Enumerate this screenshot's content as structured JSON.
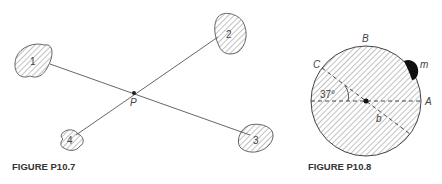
{
  "figures": [
    {
      "caption": "FIGURE P10.7",
      "point_label": "P",
      "bodies": [
        {
          "label": "1"
        },
        {
          "label": "2"
        },
        {
          "label": "3"
        },
        {
          "label": "4"
        }
      ]
    },
    {
      "caption": "FIGURE P10.8",
      "labels": {
        "a": "A",
        "b_top": "B",
        "c": "C",
        "mass": "m",
        "radius": "b",
        "angle": "37°"
      }
    }
  ],
  "colors": {
    "ink": "#333333",
    "hatch": "#777777",
    "background": "#ffffff"
  }
}
